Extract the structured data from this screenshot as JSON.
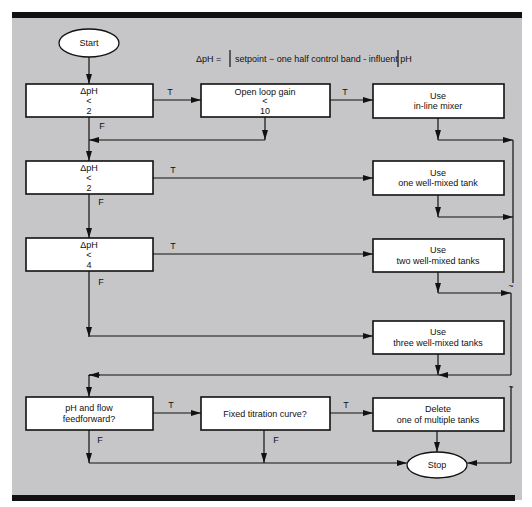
{
  "formula": {
    "lhs": "ΔpH =",
    "rhs": "setpoint − one half control band - influent pH"
  },
  "terminals": {
    "start": "Start",
    "stop": "Stop"
  },
  "decisions": [
    {
      "id": "d1",
      "lines": [
        "ΔpH",
        "<",
        "2"
      ]
    },
    {
      "id": "d2",
      "lines": [
        "Open loop gain",
        "<",
        "10"
      ]
    },
    {
      "id": "d3",
      "lines": [
        "ΔpH",
        "<",
        "2"
      ]
    },
    {
      "id": "d4",
      "lines": [
        "ΔpH",
        "<",
        "4"
      ]
    },
    {
      "id": "d5",
      "lines": [
        "pH and flow",
        "feedforward?"
      ]
    },
    {
      "id": "d6",
      "lines": [
        "Fixed titration curve?"
      ]
    }
  ],
  "actions": [
    {
      "id": "a1",
      "lines": [
        "Use",
        "in-line mixer"
      ]
    },
    {
      "id": "a2",
      "lines": [
        "Use",
        "one well-mixed tank"
      ]
    },
    {
      "id": "a3",
      "lines": [
        "Use",
        "two well-mixed tanks"
      ]
    },
    {
      "id": "a4",
      "lines": [
        "Use",
        "three well-mixed tanks"
      ]
    },
    {
      "id": "a5",
      "lines": [
        "Delete",
        "one of multiple tanks"
      ]
    }
  ],
  "branch_labels": {
    "true": "T",
    "false": "F"
  },
  "break_mark": "~"
}
